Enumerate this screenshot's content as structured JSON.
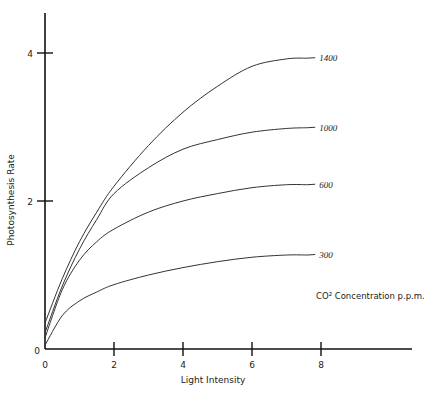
{
  "chart_data": {
    "type": "line",
    "title": "",
    "xlabel": "Light Intensity",
    "ylabel": "Photosynthesis Rate",
    "xlim": [
      0,
      11.2
    ],
    "ylim": [
      0,
      4.6
    ],
    "x_ticks": [
      0,
      2,
      4,
      6,
      8
    ],
    "y_ticks": [
      0,
      2,
      4
    ],
    "grid": false,
    "legend_title": "CO² Concentration p.p.m.",
    "legend_position": "right, inline labels at line ends",
    "series": [
      {
        "name": "1400",
        "x": [
          0,
          0.5,
          1,
          1.5,
          2,
          3,
          4,
          5,
          6,
          7,
          7.6
        ],
        "y": [
          0.35,
          0.95,
          1.45,
          1.85,
          2.2,
          2.75,
          3.2,
          3.55,
          3.82,
          3.92,
          3.93
        ]
      },
      {
        "name": "1000",
        "x": [
          0,
          0.5,
          1,
          1.5,
          2,
          3,
          4,
          5,
          6,
          7,
          7.6
        ],
        "y": [
          0.22,
          0.85,
          1.35,
          1.75,
          2.1,
          2.45,
          2.7,
          2.83,
          2.93,
          2.98,
          2.99
        ]
      },
      {
        "name": "600",
        "x": [
          0,
          0.5,
          1,
          1.5,
          2,
          3,
          4,
          5,
          6,
          7,
          7.6
        ],
        "y": [
          0.15,
          0.8,
          1.2,
          1.45,
          1.62,
          1.85,
          2.0,
          2.1,
          2.18,
          2.22,
          2.22
        ]
      },
      {
        "name": "300",
        "x": [
          0,
          0.5,
          1,
          1.5,
          2,
          3,
          4,
          5,
          6,
          7,
          7.6
        ],
        "y": [
          0.05,
          0.45,
          0.65,
          0.77,
          0.87,
          1.0,
          1.1,
          1.18,
          1.24,
          1.27,
          1.27
        ]
      }
    ]
  },
  "labels": {
    "xlabel": "Light Intensity",
    "ylabel": "Photosynthesis Rate",
    "legend_title": "CO² Concentration p.p.m.",
    "x_ticks": [
      "0",
      "2",
      "4",
      "6",
      "8"
    ],
    "y_ticks": [
      "0",
      "2",
      "4"
    ],
    "series": [
      "1400",
      "1000",
      "600",
      "300"
    ]
  }
}
